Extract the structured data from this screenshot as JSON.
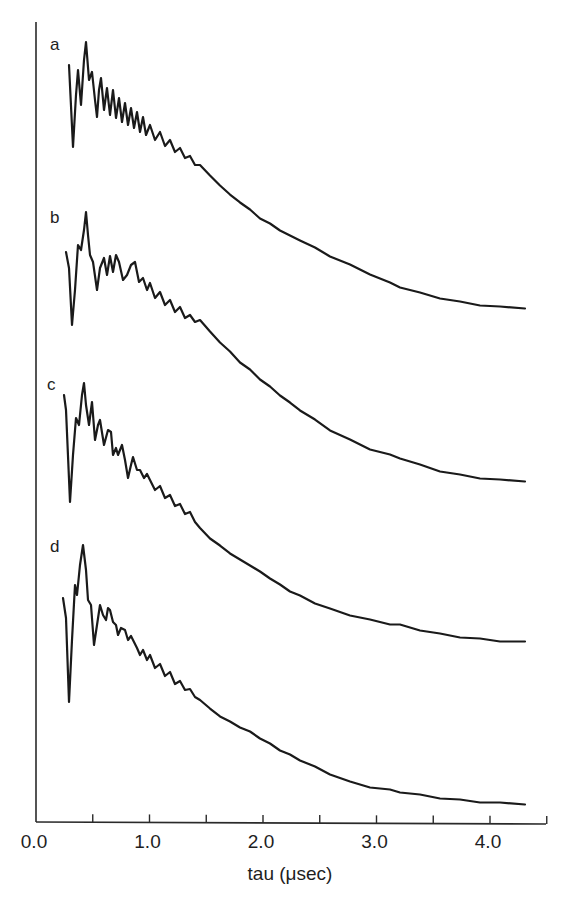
{
  "chart_data": {
    "type": "line",
    "title": "",
    "xlabel": "tau (μsec)",
    "ylabel": "",
    "xlim": [
      0.0,
      4.5
    ],
    "x_ticks_major": [
      "0.0",
      "1.0",
      "2.0",
      "3.0",
      "4.0"
    ],
    "x_ticks_minor": [
      0.5,
      1.5,
      2.5,
      3.5,
      4.5
    ],
    "grid": false,
    "legend": "inline letter labels at left of each trace",
    "y_units": "arbitrary (traces vertically offset)",
    "series": [
      {
        "name": "a",
        "label_pos": [
          50,
          50
        ],
        "pixel_points": [
          [
            69,
            65
          ],
          [
            73,
            147
          ],
          [
            76,
            95
          ],
          [
            78,
            70
          ],
          [
            81,
            105
          ],
          [
            84,
            60
          ],
          [
            86,
            42
          ],
          [
            89,
            80
          ],
          [
            92,
            72
          ],
          [
            95,
            100
          ],
          [
            97,
            117
          ],
          [
            99,
            90
          ],
          [
            101,
            78
          ],
          [
            104,
            110
          ],
          [
            107,
            88
          ],
          [
            110,
            115
          ],
          [
            113,
            90
          ],
          [
            116,
            118
          ],
          [
            119,
            98
          ],
          [
            122,
            122
          ],
          [
            125,
            103
          ],
          [
            128,
            125
          ],
          [
            131,
            108
          ],
          [
            134,
            128
          ],
          [
            137,
            112
          ],
          [
            140,
            132
          ],
          [
            143,
            117
          ],
          [
            146,
            135
          ],
          [
            150,
            125
          ],
          [
            155,
            140
          ],
          [
            160,
            132
          ],
          [
            165,
            146
          ],
          [
            170,
            140
          ],
          [
            175,
            152
          ],
          [
            180,
            148
          ],
          [
            185,
            158
          ],
          [
            190,
            156
          ],
          [
            195,
            165
          ],
          [
            200,
            165
          ],
          [
            210,
            176
          ],
          [
            220,
            185
          ],
          [
            230,
            195
          ],
          [
            240,
            202
          ],
          [
            250,
            210
          ],
          [
            260,
            218
          ],
          [
            270,
            224
          ],
          [
            280,
            230
          ],
          [
            290,
            236
          ],
          [
            300,
            240
          ],
          [
            315,
            248
          ],
          [
            330,
            256
          ],
          [
            350,
            265
          ],
          [
            370,
            274
          ],
          [
            390,
            283
          ],
          [
            400,
            287
          ],
          [
            420,
            293
          ],
          [
            440,
            298
          ],
          [
            460,
            302
          ],
          [
            480,
            305
          ],
          [
            500,
            307
          ],
          [
            525,
            308
          ]
        ]
      },
      {
        "name": "b",
        "label_pos": [
          50,
          223
        ],
        "pixel_points": [
          [
            66,
            252
          ],
          [
            69,
            268
          ],
          [
            72,
            325
          ],
          [
            75,
            290
          ],
          [
            78,
            245
          ],
          [
            81,
            250
          ],
          [
            84,
            230
          ],
          [
            86,
            212
          ],
          [
            88,
            235
          ],
          [
            90,
            255
          ],
          [
            93,
            262
          ],
          [
            97,
            290
          ],
          [
            100,
            268
          ],
          [
            104,
            258
          ],
          [
            107,
            275
          ],
          [
            110,
            256
          ],
          [
            113,
            272
          ],
          [
            116,
            255
          ],
          [
            119,
            262
          ],
          [
            123,
            280
          ],
          [
            127,
            275
          ],
          [
            131,
            265
          ],
          [
            135,
            262
          ],
          [
            139,
            282
          ],
          [
            143,
            278
          ],
          [
            147,
            290
          ],
          [
            150,
            283
          ],
          [
            155,
            298
          ],
          [
            160,
            292
          ],
          [
            165,
            305
          ],
          [
            170,
            300
          ],
          [
            175,
            312
          ],
          [
            180,
            307
          ],
          [
            185,
            318
          ],
          [
            190,
            315
          ],
          [
            195,
            322
          ],
          [
            200,
            320
          ],
          [
            210,
            332
          ],
          [
            220,
            342
          ],
          [
            230,
            352
          ],
          [
            240,
            362
          ],
          [
            250,
            370
          ],
          [
            260,
            379
          ],
          [
            270,
            387
          ],
          [
            280,
            395
          ],
          [
            290,
            403
          ],
          [
            300,
            410
          ],
          [
            315,
            420
          ],
          [
            330,
            430
          ],
          [
            350,
            440
          ],
          [
            370,
            449
          ],
          [
            390,
            455
          ],
          [
            400,
            458
          ],
          [
            420,
            465
          ],
          [
            440,
            471
          ],
          [
            460,
            475
          ],
          [
            480,
            478
          ],
          [
            500,
            480
          ],
          [
            525,
            481
          ]
        ]
      },
      {
        "name": "c",
        "label_pos": [
          47,
          390
        ],
        "pixel_points": [
          [
            64,
            395
          ],
          [
            66,
            410
          ],
          [
            70,
            502
          ],
          [
            73,
            455
          ],
          [
            76,
            418
          ],
          [
            79,
            425
          ],
          [
            82,
            395
          ],
          [
            84,
            383
          ],
          [
            86,
            405
          ],
          [
            89,
            425
          ],
          [
            92,
            402
          ],
          [
            95,
            440
          ],
          [
            98,
            425
          ],
          [
            100,
            420
          ],
          [
            104,
            445
          ],
          [
            108,
            430
          ],
          [
            111,
            432
          ],
          [
            113,
            455
          ],
          [
            116,
            448
          ],
          [
            118,
            455
          ],
          [
            122,
            445
          ],
          [
            125,
            460
          ],
          [
            128,
            478
          ],
          [
            131,
            465
          ],
          [
            133,
            457
          ],
          [
            137,
            470
          ],
          [
            140,
            470
          ],
          [
            144,
            478
          ],
          [
            147,
            474
          ],
          [
            150,
            480
          ],
          [
            155,
            490
          ],
          [
            160,
            486
          ],
          [
            165,
            498
          ],
          [
            170,
            495
          ],
          [
            175,
            506
          ],
          [
            180,
            504
          ],
          [
            185,
            514
          ],
          [
            190,
            512
          ],
          [
            195,
            522
          ],
          [
            200,
            528
          ],
          [
            210,
            538
          ],
          [
            220,
            546
          ],
          [
            230,
            553
          ],
          [
            240,
            560
          ],
          [
            250,
            565
          ],
          [
            260,
            572
          ],
          [
            270,
            578
          ],
          [
            280,
            585
          ],
          [
            290,
            591
          ],
          [
            300,
            596
          ],
          [
            315,
            603
          ],
          [
            330,
            609
          ],
          [
            350,
            615
          ],
          [
            370,
            620
          ],
          [
            390,
            624
          ],
          [
            400,
            625
          ],
          [
            420,
            630
          ],
          [
            440,
            634
          ],
          [
            460,
            637
          ],
          [
            480,
            639
          ],
          [
            500,
            641
          ],
          [
            525,
            642
          ]
        ]
      },
      {
        "name": "d",
        "label_pos": [
          50,
          552
        ],
        "pixel_points": [
          [
            63,
            598
          ],
          [
            66,
            618
          ],
          [
            69,
            702
          ],
          [
            72,
            640
          ],
          [
            75,
            585
          ],
          [
            77,
            595
          ],
          [
            80,
            565
          ],
          [
            83,
            545
          ],
          [
            86,
            570
          ],
          [
            88,
            600
          ],
          [
            91,
            605
          ],
          [
            94,
            645
          ],
          [
            97,
            625
          ],
          [
            100,
            605
          ],
          [
            103,
            615
          ],
          [
            106,
            620
          ],
          [
            108,
            608
          ],
          [
            110,
            610
          ],
          [
            113,
            622
          ],
          [
            116,
            625
          ],
          [
            118,
            635
          ],
          [
            121,
            628
          ],
          [
            125,
            630
          ],
          [
            128,
            640
          ],
          [
            131,
            636
          ],
          [
            133,
            640
          ],
          [
            137,
            648
          ],
          [
            140,
            655
          ],
          [
            143,
            650
          ],
          [
            147,
            660
          ],
          [
            150,
            655
          ],
          [
            155,
            668
          ],
          [
            160,
            664
          ],
          [
            165,
            676
          ],
          [
            170,
            672
          ],
          [
            175,
            684
          ],
          [
            180,
            681
          ],
          [
            185,
            690
          ],
          [
            190,
            689
          ],
          [
            195,
            697
          ],
          [
            200,
            700
          ],
          [
            210,
            709
          ],
          [
            220,
            716
          ],
          [
            230,
            722
          ],
          [
            240,
            727
          ],
          [
            250,
            732
          ],
          [
            260,
            738
          ],
          [
            270,
            744
          ],
          [
            280,
            750
          ],
          [
            290,
            755
          ],
          [
            300,
            760
          ],
          [
            315,
            767
          ],
          [
            330,
            774
          ],
          [
            350,
            782
          ],
          [
            370,
            787
          ],
          [
            390,
            790
          ],
          [
            400,
            792
          ],
          [
            420,
            795
          ],
          [
            440,
            798
          ],
          [
            460,
            800
          ],
          [
            480,
            802
          ],
          [
            500,
            803
          ],
          [
            525,
            804
          ]
        ]
      }
    ]
  },
  "axes": {
    "origin_px": [
      36,
      822
    ],
    "x_end_px": 546,
    "y_top_px": 22,
    "px_per_unit": 113.5
  },
  "labels": {
    "x_title": "tau (μsec)",
    "trace_a": "a",
    "trace_b": "b",
    "trace_c": "c",
    "trace_d": "d"
  },
  "colors": {
    "ink": "#1a1a1a",
    "background": "#ffffff"
  }
}
